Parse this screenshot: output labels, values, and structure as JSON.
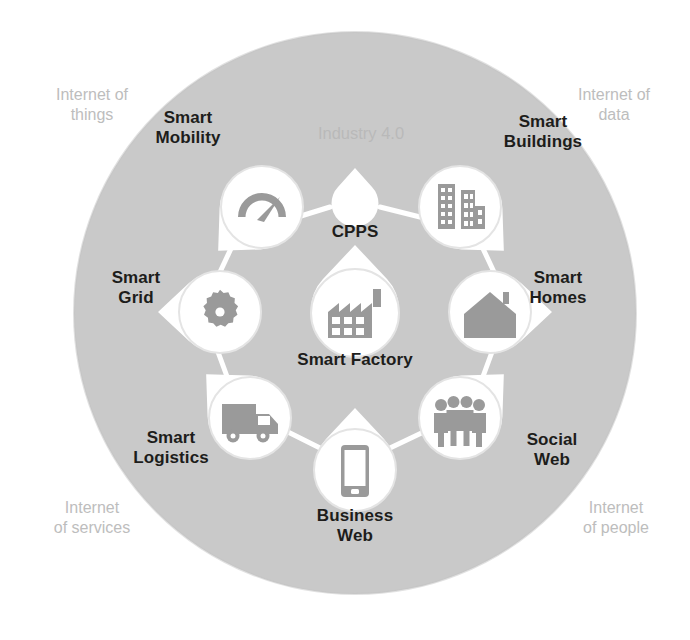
{
  "diagram": {
    "center_ring_label": "Industry 4.0",
    "background_circle_color": "#c9c9c9",
    "node_fill_color": "#ffffff",
    "icon_color": "#9a9a9a",
    "label_color": "#1d1d1b",
    "outer_label_color": "#bdbdbd",
    "connector_color": "#ffffff"
  },
  "outer_labels": [
    {
      "id": "internet-of-things",
      "text": "Internet of\nthings"
    },
    {
      "id": "internet-of-data",
      "text": "Internet of\ndata"
    },
    {
      "id": "internet-of-services",
      "text": "Internet\nof services"
    },
    {
      "id": "internet-of-people",
      "text": "Internet\nof people"
    }
  ],
  "center_nodes": [
    {
      "id": "cpps",
      "label": "CPPS",
      "icon": "none-icon"
    },
    {
      "id": "smart-factory",
      "label": "Smart Factory",
      "icon": "factory-icon"
    }
  ],
  "nodes": [
    {
      "id": "smart-mobility",
      "label": "Smart\nMobility",
      "icon": "speedometer-icon"
    },
    {
      "id": "smart-buildings",
      "label": "Smart\nBuildings",
      "icon": "buildings-icon"
    },
    {
      "id": "smart-homes",
      "label": "Smart\nHomes",
      "icon": "house-icon"
    },
    {
      "id": "social-web",
      "label": "Social\nWeb",
      "icon": "people-group-icon"
    },
    {
      "id": "business-web",
      "label": "Business\nWeb",
      "icon": "smartphone-icon"
    },
    {
      "id": "smart-logistics",
      "label": "Smart\nLogistics",
      "icon": "truck-icon"
    },
    {
      "id": "smart-grid",
      "label": "Smart\nGrid",
      "icon": "gear-icon"
    }
  ]
}
